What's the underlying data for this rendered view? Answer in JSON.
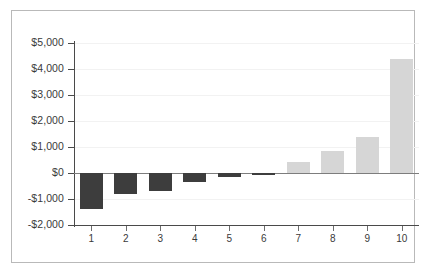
{
  "chart_data": {
    "type": "bar",
    "title": "",
    "subtitle": "",
    "xlabel": "",
    "ylabel": "",
    "categories": [
      "1",
      "2",
      "3",
      "4",
      "5",
      "6",
      "7",
      "8",
      "9",
      "10"
    ],
    "values": [
      -1380,
      -800,
      -690,
      -330,
      -140,
      -20,
      420,
      830,
      1370,
      4400
    ],
    "series": [
      {
        "name": "Value",
        "values": [
          -1380,
          -800,
          -690,
          -330,
          -140,
          -20,
          420,
          830,
          1370,
          4400
        ]
      }
    ],
    "ylim": [
      -2000,
      5000
    ],
    "ytick_values": [
      5000,
      4000,
      3000,
      2000,
      1000,
      0,
      -1000,
      -2000
    ],
    "ytick_labels": [
      "$5,000",
      "$4,000",
      "$3,000",
      "$2,000",
      "$1,000",
      "$0",
      "-$1,000",
      "-$2,000"
    ],
    "xtick_labels": [
      "1",
      "2",
      "3",
      "4",
      "5",
      "6",
      "7",
      "8",
      "9",
      "10"
    ],
    "grid": true,
    "legend": "none",
    "colors": {
      "negative_bar": "#3d3d3d",
      "positive_bar": "#d6d6d6",
      "axis": "#4a4a4a",
      "gridline": "#f2f2f2",
      "frame_border": "#b9b9b9",
      "background": "#ffffff",
      "text": "#3a3a3a"
    },
    "bar_colors": [
      "#3d3d3d",
      "#3d3d3d",
      "#3d3d3d",
      "#3d3d3d",
      "#3d3d3d",
      "#3d3d3d",
      "#d6d6d6",
      "#d6d6d6",
      "#d6d6d6",
      "#d6d6d6"
    ]
  }
}
